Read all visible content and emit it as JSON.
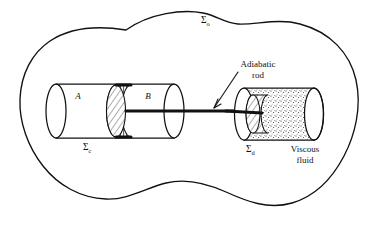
{
  "figure": {
    "type": "physics-diagram",
    "background_color": "#ffffff",
    "ink_color": "#111111"
  },
  "labels": {
    "outer_boundary": {
      "symbol": "Σ",
      "subscript": "o",
      "name": "sigma-o"
    },
    "left_cylinder": {
      "symbol": "Σ",
      "subscript": "c",
      "name": "sigma-c"
    },
    "right_cylinder": {
      "symbol": "Σ",
      "subscript": "d",
      "name": "sigma-d"
    },
    "chamber_a": "A",
    "chamber_b": "B",
    "adiabatic_rod_line1": "Adiabatic",
    "adiabatic_rod_line2": "rod",
    "viscous_fluid_line1": "Viscous",
    "viscous_fluid_line2": "fluid"
  },
  "elements": {
    "outer_boundary_name": "outer-system-boundary",
    "left_cylinder_name": "left-cylinder",
    "piston_name": "hatched-piston",
    "rod_name": "adiabatic-rod",
    "right_cylinder_name": "viscous-fluid-cylinder",
    "paddle_name": "hatched-paddle",
    "arrow_name": "adiabatic-rod-pointer"
  }
}
